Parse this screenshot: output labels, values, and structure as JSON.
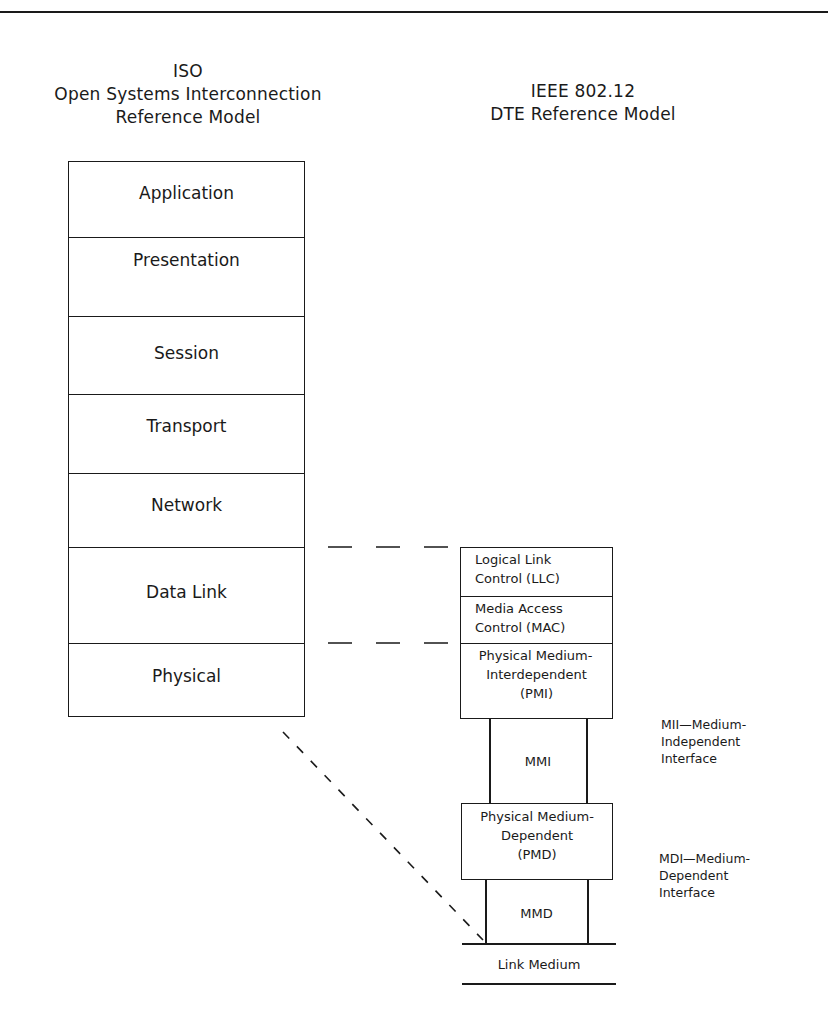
{
  "titles": {
    "osi": {
      "line1": "ISO",
      "line2": "Open Systems Interconnection",
      "line3": "Reference Model"
    },
    "ieee": {
      "line1": "IEEE 802.12",
      "line2": "DTE Reference Model"
    }
  },
  "osi_layers": [
    {
      "label": "Application"
    },
    {
      "label": "Presentation"
    },
    {
      "label": "Session"
    },
    {
      "label": "Transport"
    },
    {
      "label": "Network"
    },
    {
      "label": "Data Link"
    },
    {
      "label": "Physical"
    }
  ],
  "ieee_stack": {
    "llc": {
      "line1": "Logical Link",
      "line2": "Control (LLC)"
    },
    "mac": {
      "line1": "Media Access",
      "line2": "Control (MAC)"
    },
    "pmi": {
      "line1": "Physical Medium-",
      "line2": "Interdependent",
      "line3": "(PMI)"
    },
    "mmi": {
      "label": "MMI"
    },
    "pmd": {
      "line1": "Physical Medium-",
      "line2": "Dependent",
      "line3": "(PMD)"
    },
    "mmd": {
      "label": "MMD"
    },
    "link_medium": {
      "label": "Link Medium"
    }
  },
  "side_notes": {
    "mii": {
      "line1": "MII—Medium-",
      "line2": "Independent",
      "line3": "Interface"
    },
    "mdi": {
      "line1": "MDI—Medium-",
      "line2": "Dependent",
      "line3": "Interface"
    }
  },
  "colors": {
    "line": "#1a1a1a",
    "background": "#ffffff"
  }
}
